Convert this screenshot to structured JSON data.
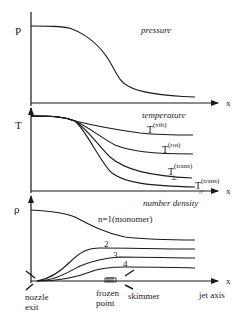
{
  "panels": {
    "pressure": {
      "y_label": "P",
      "title": "pressure",
      "x_label": "x"
    },
    "temperature": {
      "y_label": "T",
      "title": "temperature",
      "x_label": "x",
      "curves": [
        {
          "name": "T",
          "sup": "(vib)",
          "sub": ""
        },
        {
          "name": "T",
          "sup": "(rot)",
          "sub": ""
        },
        {
          "name": "T",
          "sup": "(trans)",
          "sub": "⊥"
        },
        {
          "name": "T",
          "sup": "(trans)",
          "sub": "//"
        }
      ]
    },
    "density": {
      "y_label": "ρ",
      "title": "number density",
      "x_label": "x",
      "curves": [
        {
          "label": "n=1(monomer)"
        },
        {
          "label": "2"
        },
        {
          "label": "3"
        },
        {
          "label": "4"
        }
      ]
    }
  },
  "annotations": {
    "nozzle_line1": "nozzle",
    "nozzle_line2": "exit",
    "frozen_line1": "frozen",
    "frozen_line2": "point",
    "skimmer": "skimmer",
    "jet_axis": "jet axis"
  }
}
